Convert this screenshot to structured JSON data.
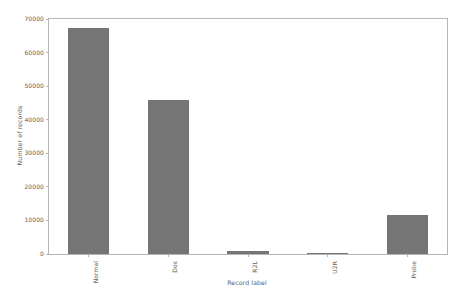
{
  "chart_data": {
    "type": "bar",
    "title": "",
    "xlabel": "Record label",
    "ylabel": "Number of records",
    "categories": [
      "Normal",
      "Dos",
      "R2L",
      "U2R",
      "Probe"
    ],
    "values": [
      67343,
      45927,
      995,
      52,
      11656
    ],
    "ylim": [
      0,
      70000
    ],
    "yticks": [
      0,
      10000,
      20000,
      30000,
      40000,
      50000,
      60000,
      70000
    ],
    "ytick_labels": [
      "0",
      "10000",
      "20000",
      "30000",
      "40000",
      "50000",
      "60000",
      "70000"
    ],
    "grid": false,
    "legend": null,
    "bar_color": "#757575",
    "axes_color": "#b6b6b6",
    "text_color": "#5e5e5e",
    "background": "#ffffff",
    "bar_width_ratio": 0.52,
    "xtick_rotation": -90
  }
}
